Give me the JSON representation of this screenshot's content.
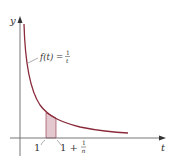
{
  "figure": {
    "y_axis_label": "y",
    "x_axis_label": "t",
    "function_label_prefix": "f(t) =",
    "function_fraction_num": "1",
    "function_fraction_den": "t",
    "lower_bound_label": "1",
    "upper_bound_prefix": "1 +",
    "upper_bound_fraction_num": "1",
    "upper_bound_fraction_den": "n",
    "colors": {
      "curve": "#8a2a3a",
      "shade": "#e3c9cf",
      "axis": "#777777",
      "text": "#333333"
    }
  }
}
